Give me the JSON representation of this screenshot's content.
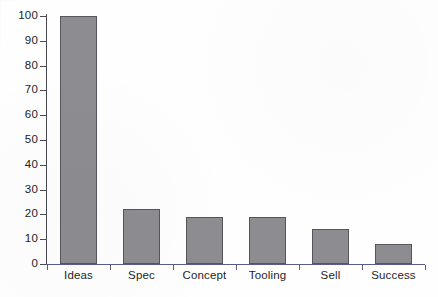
{
  "chart_data": {
    "type": "bar",
    "title": "",
    "subtitle": "",
    "xlabel": "",
    "ylabel": "",
    "categories": [
      "Ideas",
      "Spec",
      "Concept",
      "Tooling",
      "Sell",
      "Success"
    ],
    "values": [
      100,
      22,
      19,
      19,
      14,
      8
    ],
    "ylim": [
      0,
      100
    ],
    "yticks": [
      0,
      10,
      20,
      30,
      40,
      50,
      60,
      70,
      80,
      90,
      100
    ],
    "ytick_labels": [
      "0",
      "10",
      "20",
      "30",
      "40",
      "50",
      "60",
      "70",
      "80",
      "90",
      "100"
    ],
    "grid": false,
    "legend": null,
    "series": [
      {
        "name": "count",
        "values": [
          100,
          22,
          19,
          19,
          14,
          8
        ]
      }
    ],
    "colors": {
      "bar_fill": "#8d8d91",
      "bar_edge": "#55555c",
      "axis": "#4a4a52",
      "x_axis": "#5c5c8a",
      "text": "#1f1f26",
      "background": "#ffffff"
    }
  }
}
